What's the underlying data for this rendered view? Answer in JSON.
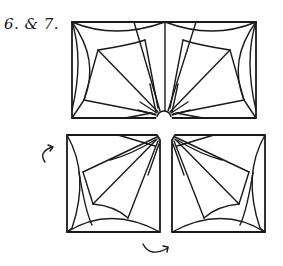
{
  "caption": "6. & 7.",
  "figure": {
    "stroke_color": "#1a1a1a",
    "background": "#ffffff",
    "top_rectangle": {
      "x": 72,
      "y": 22,
      "width": 184,
      "height": 96,
      "divider_x": 165,
      "notch_radius": 7
    },
    "bottom_left_square": {
      "x": 67,
      "y": 135,
      "width": 93,
      "height": 97
    },
    "bottom_right_square": {
      "x": 172,
      "y": 135,
      "width": 93,
      "height": 97
    },
    "arrows": [
      {
        "name": "rotate-left-arrow",
        "position": "left of bottom-left square"
      },
      {
        "name": "rotate-bottom-arrow",
        "position": "below the gap between bottom squares"
      }
    ]
  }
}
